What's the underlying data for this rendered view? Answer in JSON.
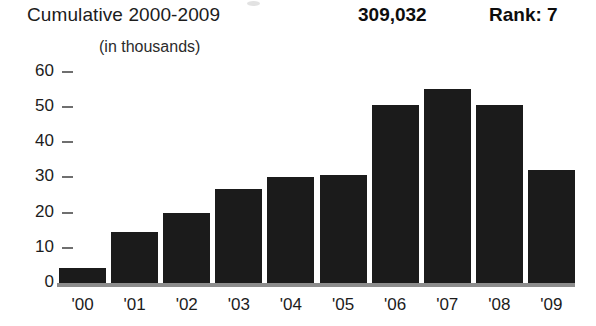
{
  "header": {
    "title": "Cumulative 2000-2009",
    "value": "309,032",
    "rank": "Rank: 7",
    "subtitle": "(in thousands)"
  },
  "colors": {
    "bar": "#1b1b1b",
    "background": "#ffffff",
    "axis": "#8c8c8c",
    "tick": "#6f6f6f",
    "text": "#1c1c1c"
  },
  "chart_data": {
    "type": "bar",
    "title": "Cumulative 2000-2009",
    "subtitle": "(in thousands)",
    "xlabel": "",
    "ylabel": "",
    "grid": false,
    "legend": null,
    "ylim": [
      0,
      62
    ],
    "yticks": [
      0,
      10,
      20,
      30,
      40,
      50,
      60
    ],
    "ytick_labels": [
      "0",
      "10",
      "20",
      "30",
      "40",
      "50",
      "60"
    ],
    "categories": [
      "'00",
      "'01",
      "'02",
      "'03",
      "'04",
      "'05",
      "'06",
      "'07",
      "'08",
      "'09"
    ],
    "values": [
      4.4,
      14.5,
      20.0,
      26.7,
      30.0,
      30.8,
      50.5,
      55.0,
      50.5,
      32.0
    ],
    "total_label": "309,032",
    "rank_label": "Rank: 7"
  }
}
